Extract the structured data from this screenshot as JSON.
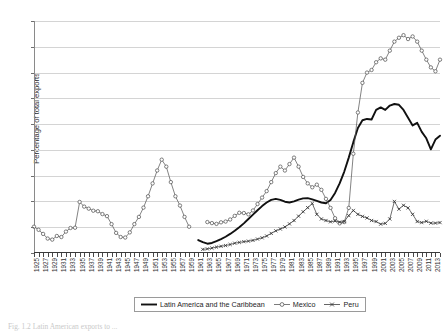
{
  "figure": {
    "caption": "Fig. 1.2  Latin American exports to ...",
    "background": "#ffffff"
  },
  "legend": {
    "position": "bottom-center",
    "items": [
      {
        "label": "Latin America and the Caribbean",
        "marker": "none",
        "style": "thick-solid-line",
        "color": "#111111"
      },
      {
        "label": "Mexico",
        "marker": "open-circle",
        "style": "thin-line-with-markers",
        "color": "#5a5a5a"
      },
      {
        "label": "Peru",
        "marker": "cross",
        "style": "thin-line-with-markers",
        "color": "#3d3d3d"
      }
    ]
  },
  "chart_data": {
    "type": "line",
    "title": "",
    "xlabel": "",
    "ylabel": "Percentage of total exports",
    "ylim": [
      0,
      90
    ],
    "yticks": [
      0,
      10,
      20,
      30,
      40,
      50,
      60,
      70,
      80,
      90
    ],
    "grid": "horizontal",
    "xlim": [
      1925,
      2014
    ],
    "x_tick_labels": [
      "1925",
      "1927",
      "1929",
      "1931",
      "1933",
      "1935",
      "1937",
      "1939",
      "1941",
      "1943",
      "1945",
      "1947",
      "1949",
      "1951",
      "1953",
      "1955",
      "1957",
      "1959",
      "1961",
      "1963",
      "1965",
      "1967",
      "1969",
      "1971",
      "1973",
      "1975",
      "1977",
      "1979",
      "1981",
      "1983",
      "1985",
      "1987",
      "1989",
      "1991",
      "1993",
      "1995",
      "1997",
      "1999",
      "2001",
      "2003",
      "2005",
      "2007",
      "2009",
      "2011",
      "2013"
    ],
    "series": [
      {
        "name": "Latin America and the Caribbean",
        "marker": "none",
        "color": "#111111",
        "points": [
          [
            1961,
            5.0
          ],
          [
            1962,
            4.2
          ],
          [
            1963,
            3.6
          ],
          [
            1964,
            3.9
          ],
          [
            1965,
            4.6
          ],
          [
            1966,
            5.4
          ],
          [
            1967,
            6.3
          ],
          [
            1968,
            7.4
          ],
          [
            1969,
            8.6
          ],
          [
            1970,
            10.0
          ],
          [
            1971,
            11.5
          ],
          [
            1972,
            13.2
          ],
          [
            1973,
            14.9
          ],
          [
            1974,
            16.6
          ],
          [
            1975,
            18.2
          ],
          [
            1976,
            19.6
          ],
          [
            1977,
            20.6
          ],
          [
            1978,
            21.0
          ],
          [
            1979,
            20.6
          ],
          [
            1980,
            19.9
          ],
          [
            1981,
            19.6
          ],
          [
            1982,
            20.0
          ],
          [
            1983,
            20.7
          ],
          [
            1984,
            21.2
          ],
          [
            1985,
            21.3
          ],
          [
            1986,
            20.8
          ],
          [
            1987,
            20.2
          ],
          [
            1988,
            19.6
          ],
          [
            1989,
            19.3
          ],
          [
            1990,
            20.6
          ],
          [
            1991,
            23.3
          ],
          [
            1992,
            27.0
          ],
          [
            1993,
            31.5
          ],
          [
            1994,
            37.0
          ],
          [
            1995,
            43.0
          ],
          [
            1996,
            48.5
          ],
          [
            1997,
            51.5
          ],
          [
            1998,
            52.0
          ],
          [
            1999,
            51.8
          ],
          [
            2000,
            55.5
          ],
          [
            2001,
            56.5
          ],
          [
            2002,
            55.5
          ],
          [
            2003,
            57.2
          ],
          [
            2004,
            57.8
          ],
          [
            2005,
            57.5
          ],
          [
            2006,
            55.5
          ],
          [
            2007,
            52.5
          ],
          [
            2008,
            49.5
          ],
          [
            2009,
            50.5
          ],
          [
            2010,
            47.0
          ],
          [
            2011,
            44.5
          ],
          [
            2012,
            40.2
          ],
          [
            2013,
            44.0
          ],
          [
            2014,
            45.5
          ]
        ]
      },
      {
        "name": "Mexico",
        "marker": "open-circle",
        "color": "#5a5a5a",
        "points": [
          [
            1925,
            10.2
          ],
          [
            1926,
            9.0
          ],
          [
            1927,
            7.4
          ],
          [
            1928,
            5.6
          ],
          [
            1929,
            5.2
          ],
          [
            1930,
            6.6
          ],
          [
            1931,
            6.2
          ],
          [
            1932,
            8.3
          ],
          [
            1933,
            9.7
          ],
          [
            1934,
            9.8
          ],
          [
            1935,
            19.8
          ],
          [
            1936,
            18.0
          ],
          [
            1937,
            17.2
          ],
          [
            1938,
            16.4
          ],
          [
            1939,
            16.2
          ],
          [
            1940,
            15.1
          ],
          [
            1941,
            14.3
          ],
          [
            1942,
            11.2
          ],
          [
            1943,
            7.8
          ],
          [
            1944,
            6.2
          ],
          [
            1945,
            6.0
          ],
          [
            1946,
            8.0
          ],
          [
            1947,
            11.2
          ],
          [
            1948,
            14.0
          ],
          [
            1949,
            17.6
          ],
          [
            1950,
            22.0
          ],
          [
            1951,
            27.0
          ],
          [
            1952,
            32.0
          ],
          [
            1953,
            36.2
          ],
          [
            1954,
            33.5
          ],
          [
            1955,
            27.5
          ],
          [
            1956,
            22.0
          ],
          [
            1957,
            18.4
          ],
          [
            1958,
            14.0
          ],
          [
            1959,
            10.2
          ]
        ]
      },
      {
        "name": "Mexico",
        "marker": "open-circle",
        "color": "#5a5a5a",
        "segment": 2,
        "points": [
          [
            1963,
            12.0
          ],
          [
            1964,
            11.6
          ],
          [
            1965,
            11.3
          ],
          [
            1966,
            11.9
          ],
          [
            1967,
            12.2
          ],
          [
            1968,
            13.0
          ],
          [
            1969,
            14.4
          ],
          [
            1970,
            15.6
          ],
          [
            1971,
            15.5
          ],
          [
            1972,
            15.0
          ],
          [
            1973,
            16.5
          ],
          [
            1974,
            19.0
          ],
          [
            1975,
            21.5
          ],
          [
            1976,
            24.0
          ],
          [
            1977,
            27.5
          ],
          [
            1978,
            31.0
          ],
          [
            1979,
            33.5
          ],
          [
            1980,
            32.0
          ],
          [
            1981,
            34.5
          ],
          [
            1982,
            37.0
          ],
          [
            1983,
            33.5
          ],
          [
            1984,
            29.5
          ],
          [
            1985,
            27.0
          ],
          [
            1986,
            25.5
          ],
          [
            1987,
            26.5
          ],
          [
            1988,
            24.5
          ],
          [
            1989,
            21.0
          ],
          [
            1990,
            17.5
          ],
          [
            1991,
            13.5
          ],
          [
            1992,
            11.5
          ],
          [
            1993,
            12.0
          ],
          [
            1994,
            17.5
          ],
          [
            1995,
            38.5
          ],
          [
            1996,
            54.5
          ],
          [
            1997,
            66.0
          ],
          [
            1998,
            70.0
          ],
          [
            1999,
            71.0
          ],
          [
            2000,
            74.0
          ],
          [
            2001,
            75.5
          ],
          [
            2002,
            75.0
          ],
          [
            2003,
            78.5
          ],
          [
            2004,
            82.0
          ],
          [
            2005,
            83.5
          ],
          [
            2006,
            84.5
          ],
          [
            2007,
            83.0
          ],
          [
            2008,
            84.0
          ],
          [
            2009,
            82.0
          ],
          [
            2010,
            78.5
          ],
          [
            2011,
            75.0
          ],
          [
            2012,
            72.0
          ],
          [
            2013,
            70.5
          ],
          [
            2014,
            75.0
          ]
        ]
      },
      {
        "name": "Peru",
        "marker": "cross",
        "color": "#3d3d3d",
        "points": [
          [
            1962,
            1.4
          ],
          [
            1963,
            1.6
          ],
          [
            1964,
            1.9
          ],
          [
            1965,
            2.3
          ],
          [
            1966,
            2.6
          ],
          [
            1967,
            2.9
          ],
          [
            1968,
            3.3
          ],
          [
            1969,
            3.8
          ],
          [
            1970,
            4.1
          ],
          [
            1971,
            4.4
          ],
          [
            1972,
            4.6
          ],
          [
            1973,
            4.9
          ],
          [
            1974,
            5.4
          ],
          [
            1975,
            5.9
          ],
          [
            1976,
            6.6
          ],
          [
            1977,
            7.6
          ],
          [
            1978,
            8.6
          ],
          [
            1979,
            9.3
          ],
          [
            1980,
            10.1
          ],
          [
            1981,
            11.3
          ],
          [
            1982,
            12.6
          ],
          [
            1983,
            14.3
          ],
          [
            1984,
            16.0
          ],
          [
            1985,
            17.6
          ],
          [
            1986,
            19.2
          ],
          [
            1987,
            15.0
          ],
          [
            1988,
            13.2
          ],
          [
            1989,
            12.6
          ],
          [
            1990,
            12.1
          ],
          [
            1991,
            12.4
          ],
          [
            1992,
            12.0
          ],
          [
            1993,
            12.2
          ],
          [
            1994,
            14.5
          ],
          [
            1995,
            16.5
          ],
          [
            1996,
            15.0
          ],
          [
            1997,
            14.2
          ],
          [
            1998,
            13.6
          ],
          [
            1999,
            12.6
          ],
          [
            2000,
            12.2
          ],
          [
            2001,
            11.2
          ],
          [
            2002,
            11.5
          ],
          [
            2003,
            13.2
          ],
          [
            2004,
            20.0
          ],
          [
            2005,
            17.0
          ],
          [
            2006,
            18.5
          ],
          [
            2007,
            17.5
          ],
          [
            2008,
            15.0
          ],
          [
            2009,
            12.2
          ],
          [
            2010,
            11.8
          ],
          [
            2011,
            12.3
          ],
          [
            2012,
            11.6
          ],
          [
            2013,
            11.6
          ],
          [
            2014,
            11.8
          ]
        ]
      }
    ]
  }
}
